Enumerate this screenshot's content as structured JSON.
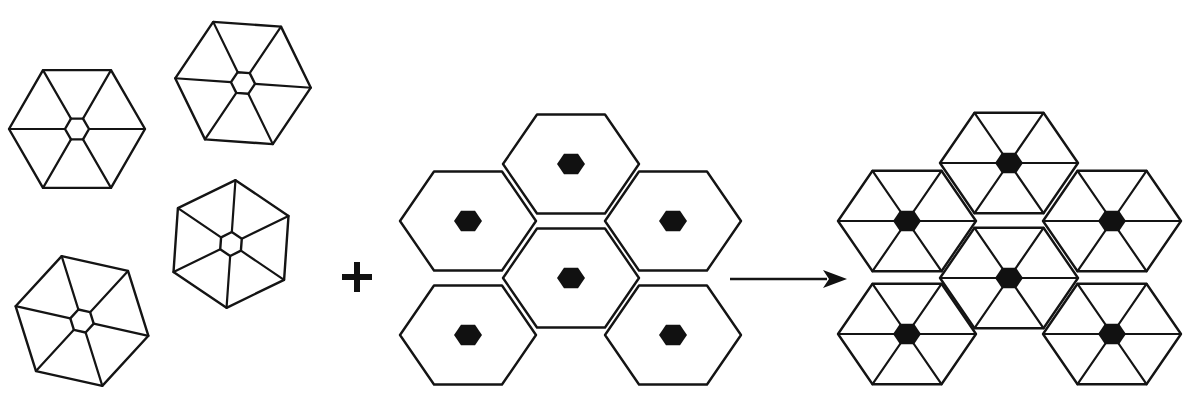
{
  "figure": {
    "stroke_color": "#141414",
    "fill_color": "#111111",
    "background": "#ffffff"
  },
  "building_blocks": {
    "label": "hexagonal subunits with central pore and six spokes",
    "items": [
      {
        "cx": 77,
        "cy": 129,
        "r": 68,
        "rotation": 0,
        "inner_r": 12
      },
      {
        "cx": 243,
        "cy": 83,
        "r": 68,
        "rotation": 4,
        "inner_r": 12
      },
      {
        "cx": 231,
        "cy": 244,
        "r": 64,
        "rotation": 34,
        "inner_r": 12
      },
      {
        "cx": 82,
        "cy": 321,
        "r": 68,
        "rotation": 12.6,
        "inner_r": 12
      }
    ]
  },
  "operator": {
    "symbol": "+",
    "cx": 357,
    "cy": 277,
    "size": 30,
    "thickness": 6
  },
  "template_lattice": {
    "label": "hexagonal lattice with filled hexagonal nodes at cell centers",
    "r": 68,
    "dot_r": 14,
    "cells": [
      {
        "cx": 571,
        "cy": 164
      },
      {
        "cx": 468,
        "cy": 221
      },
      {
        "cx": 673,
        "cy": 221
      },
      {
        "cx": 571,
        "cy": 278
      },
      {
        "cx": 468,
        "cy": 335
      },
      {
        "cx": 673,
        "cy": 335
      }
    ]
  },
  "arrow": {
    "x1": 730,
    "y1": 279,
    "x2": 847,
    "y2": 279,
    "head_length": 24,
    "head_half_width": 9
  },
  "product_lattice": {
    "label": "assembled lattice: each cell triangulated by spokes, filled nodes at cell centers",
    "r": 69,
    "dot_r": 14,
    "cells": [
      {
        "cx": 1009,
        "cy": 163
      },
      {
        "cx": 907,
        "cy": 221
      },
      {
        "cx": 1112,
        "cy": 221
      },
      {
        "cx": 1009,
        "cy": 278
      },
      {
        "cx": 907,
        "cy": 334
      },
      {
        "cx": 1112,
        "cy": 334
      }
    ]
  }
}
